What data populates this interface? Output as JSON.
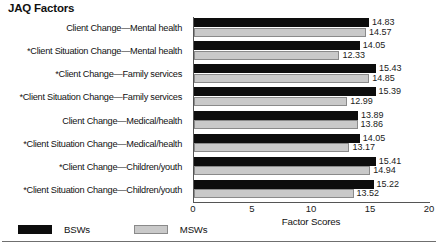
{
  "chart_data": {
    "type": "bar",
    "orientation": "horizontal",
    "title": "JAQ Factors",
    "xlabel": "Factor Scores",
    "ylabel": "",
    "xlim": [
      0,
      20
    ],
    "xticks": [
      0,
      5,
      10,
      15,
      20
    ],
    "xtick_labels": [
      "0",
      "5",
      "10",
      "15",
      "20"
    ],
    "grid": false,
    "legend_position": "bottom-left",
    "categories": [
      "Client Change—Mental health",
      "*Client Situation Change—Mental health",
      "*Client Change—Family services",
      "*Client Situation Change—Family services",
      "Client Change—Medical/health",
      "*Client Situation Change—Medical/health",
      "*Client Change—Children/youth",
      "*Client Situation Change—Children/youth"
    ],
    "series": [
      {
        "name": "BSWs",
        "color": "#0d0d0d",
        "values": [
          14.83,
          14.05,
          15.43,
          15.39,
          13.89,
          14.05,
          15.41,
          15.22
        ],
        "value_labels": [
          "14.83",
          "14.05",
          "15.43",
          "15.39",
          "13.89",
          "14.05",
          "15.41",
          "15.22"
        ]
      },
      {
        "name": "MSWs",
        "color": "#c9c9c9",
        "values": [
          14.57,
          12.33,
          14.85,
          12.99,
          13.86,
          13.17,
          14.94,
          13.52
        ],
        "value_labels": [
          "14.57",
          "12.33",
          "14.85",
          "12.99",
          "13.86",
          "13.17",
          "14.94",
          "13.52"
        ]
      }
    ]
  },
  "legend": {
    "items": [
      {
        "label": "BSWs",
        "swatch": "bsw"
      },
      {
        "label": "MSWs",
        "swatch": "msw"
      }
    ]
  }
}
